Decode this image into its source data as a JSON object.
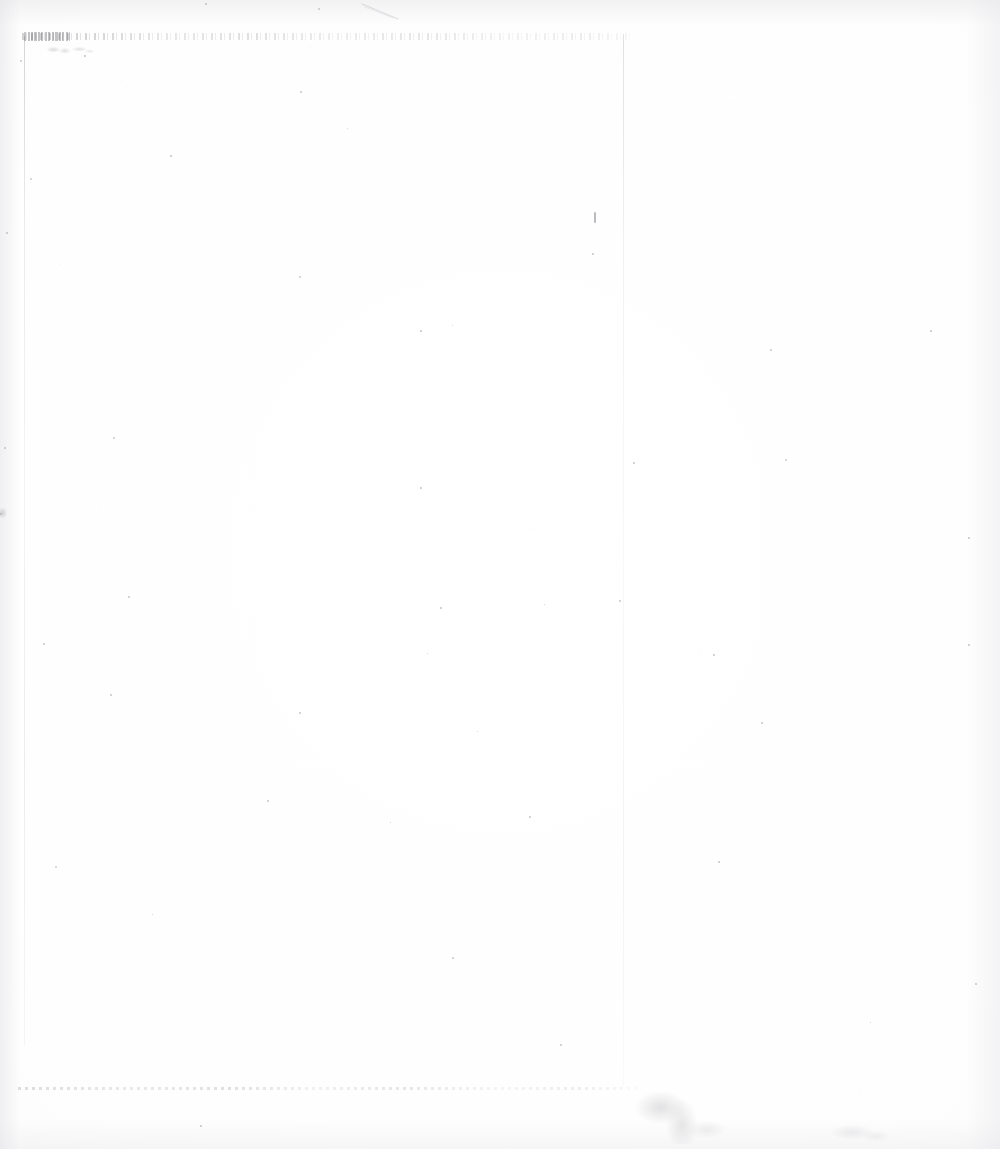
{
  "document": {
    "kind": "scanned-page",
    "condition": "severely faded / washed out",
    "page_background_color": "#fdfdfd",
    "ink_color": "#5a5a62",
    "width": 1000,
    "height": 1149,
    "caption": "Faded blank scanned document page with an illegible header line"
  },
  "header": {
    "line_text": "",
    "legible": "false",
    "note": "illegible faded typed line"
  },
  "subheader": {
    "smudge_text": "",
    "legible": "false"
  },
  "body": {
    "text": "",
    "note": "blank page area"
  },
  "footer": {
    "rule_text": "",
    "legible": "false"
  },
  "marks": {
    "ink_tick_label": "",
    "scratch_label": "",
    "stain_label": "",
    "stain_secondary_label": "",
    "edge_mark_label": ""
  },
  "rules": {
    "left_margin_label": "",
    "column_rule_label": ""
  },
  "specks": [
    {
      "x": 318,
      "y": 8,
      "size": 2.0
    },
    {
      "x": 205,
      "y": 3,
      "size": 1.6
    },
    {
      "x": 20,
      "y": 60,
      "size": 1.8
    },
    {
      "x": 84,
      "y": 55,
      "size": 1.5
    },
    {
      "x": 300,
      "y": 91,
      "size": 1.6
    },
    {
      "x": 30,
      "y": 178,
      "size": 2.2
    },
    {
      "x": 170,
      "y": 155,
      "size": 1.5
    },
    {
      "x": 347,
      "y": 128,
      "size": 1.4
    },
    {
      "x": 299,
      "y": 276,
      "size": 1.8
    },
    {
      "x": 592,
      "y": 253,
      "size": 1.5
    },
    {
      "x": 6,
      "y": 232,
      "size": 1.6
    },
    {
      "x": 420,
      "y": 330,
      "size": 1.7
    },
    {
      "x": 452,
      "y": 325,
      "size": 1.4
    },
    {
      "x": 770,
      "y": 349,
      "size": 1.6
    },
    {
      "x": 930,
      "y": 330,
      "size": 1.5
    },
    {
      "x": 113,
      "y": 437,
      "size": 1.8
    },
    {
      "x": 4,
      "y": 447,
      "size": 1.6
    },
    {
      "x": 420,
      "y": 487,
      "size": 1.5
    },
    {
      "x": 0,
      "y": 513,
      "size": 2.4
    },
    {
      "x": 633,
      "y": 462,
      "size": 1.5
    },
    {
      "x": 785,
      "y": 459,
      "size": 2.0
    },
    {
      "x": 968,
      "y": 537,
      "size": 1.5
    },
    {
      "x": 128,
      "y": 596,
      "size": 1.6
    },
    {
      "x": 440,
      "y": 607,
      "size": 1.5
    },
    {
      "x": 544,
      "y": 604,
      "size": 1.4
    },
    {
      "x": 619,
      "y": 600,
      "size": 1.6
    },
    {
      "x": 43,
      "y": 643,
      "size": 1.5
    },
    {
      "x": 427,
      "y": 653,
      "size": 1.4
    },
    {
      "x": 713,
      "y": 654,
      "size": 1.6
    },
    {
      "x": 968,
      "y": 644,
      "size": 1.5
    },
    {
      "x": 110,
      "y": 694,
      "size": 1.7
    },
    {
      "x": 299,
      "y": 712,
      "size": 1.5
    },
    {
      "x": 477,
      "y": 731,
      "size": 1.4
    },
    {
      "x": 761,
      "y": 722,
      "size": 1.5
    },
    {
      "x": 55,
      "y": 866,
      "size": 2.1
    },
    {
      "x": 267,
      "y": 800,
      "size": 1.5
    },
    {
      "x": 390,
      "y": 822,
      "size": 1.4
    },
    {
      "x": 529,
      "y": 816,
      "size": 1.6
    },
    {
      "x": 718,
      "y": 861,
      "size": 1.5
    },
    {
      "x": 152,
      "y": 914,
      "size": 1.4
    },
    {
      "x": 452,
      "y": 957,
      "size": 1.6
    },
    {
      "x": 560,
      "y": 1044,
      "size": 1.5
    },
    {
      "x": 200,
      "y": 1125,
      "size": 1.7
    },
    {
      "x": 870,
      "y": 1022,
      "size": 1.4
    },
    {
      "x": 975,
      "y": 983,
      "size": 1.5
    }
  ]
}
